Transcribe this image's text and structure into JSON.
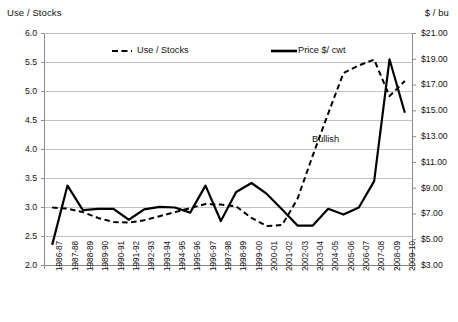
{
  "chart_data": {
    "type": "line",
    "title": "",
    "subtitle": "",
    "ylabel": "Use / Stocks",
    "y2label": "$ / bu",
    "xlabel": "",
    "grid": true,
    "legend_position": "top-inside",
    "ylim": [
      2.0,
      6.0
    ],
    "ytick_step": 0.5,
    "y2lim": [
      3.0,
      21.0
    ],
    "y2tick_step": 2.0,
    "yticks": [
      "2.0",
      "2.5",
      "3.0",
      "3.5",
      "4.0",
      "4.5",
      "5.0",
      "5.5",
      "6.0"
    ],
    "y2ticks": [
      "$3.00",
      "$5.00",
      "$7.00",
      "$9.00",
      "$11.00",
      "$13.00",
      "$15.00",
      "$17.00",
      "$19.00",
      "$21.00"
    ],
    "categories": [
      "1986-87",
      "1987-88",
      "1988-89",
      "1989-90",
      "1990-91",
      "1991-92",
      "1992-93",
      "1993-94",
      "1994-95",
      "1995-96",
      "1996-97",
      "1997-98",
      "1998-99",
      "1999-00",
      "2000-01",
      "2001-02",
      "2002-03",
      "2003-04",
      "2004-05",
      "2005-06",
      "2006-07",
      "2007-08",
      "2008-09",
      "2009-10"
    ],
    "series": [
      {
        "name": "Use / Stocks",
        "axis": "left",
        "style": "dashed",
        "color": "#000000",
        "values": [
          3.0,
          2.98,
          2.92,
          2.82,
          2.75,
          2.74,
          2.78,
          2.85,
          2.92,
          2.99,
          3.06,
          3.05,
          3.02,
          2.82,
          2.68,
          2.7,
          3.15,
          3.9,
          4.62,
          5.32,
          5.45,
          5.55,
          4.92,
          5.18
        ]
      },
      {
        "name": "Price $/ cwt",
        "axis": "right",
        "style": "solid",
        "color": "#000000",
        "values": [
          4.6,
          9.2,
          7.3,
          7.4,
          7.4,
          6.55,
          7.35,
          7.55,
          7.5,
          7.1,
          9.2,
          6.45,
          8.7,
          9.4,
          8.55,
          7.35,
          6.1,
          6.1,
          7.4,
          6.95,
          7.5,
          9.55,
          19.0,
          14.85
        ]
      }
    ],
    "annotations": [
      {
        "text": "Bullish",
        "x_category": "2004-05",
        "value_left": 4.25
      }
    ],
    "legend": [
      {
        "label": "Use / Stocks",
        "style": "dashed"
      },
      {
        "label": "Price $/ cwt",
        "style": "solid"
      }
    ]
  }
}
